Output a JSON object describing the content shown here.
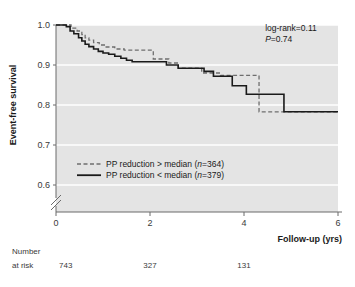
{
  "chart_data": {
    "type": "line",
    "subtype": "kaplan-meier-step",
    "title": "",
    "xlabel": "Follow-up (yrs)",
    "ylabel": "Event-free survival",
    "xlim": [
      0,
      6
    ],
    "ylim": [
      0.6,
      1.0
    ],
    "y_axis_break": true,
    "xticks": [
      0,
      2,
      4,
      6
    ],
    "xtick_labels": [
      "0",
      "2",
      "4",
      "6"
    ],
    "yticks": [
      0.6,
      0.7,
      0.8,
      0.9,
      1.0
    ],
    "ytick_labels": [
      "0.6",
      "0.7",
      "0.8",
      "0.9",
      "1.0"
    ],
    "grid": "horizontal-white",
    "plot_bg": "#e4e4e4",
    "legend_position": "lower-left-inside",
    "series": [
      {
        "name": "PP reduction > median (n=364)",
        "style": "dashed",
        "color": "#6e6e6e",
        "n": 364,
        "points": [
          [
            0.0,
            1.0
          ],
          [
            0.25,
            1.0
          ],
          [
            0.32,
            0.992
          ],
          [
            0.45,
            0.985
          ],
          [
            0.55,
            0.976
          ],
          [
            0.62,
            0.968
          ],
          [
            0.7,
            0.962
          ],
          [
            0.8,
            0.956
          ],
          [
            0.92,
            0.95
          ],
          [
            1.05,
            0.945
          ],
          [
            1.25,
            0.94
          ],
          [
            1.45,
            0.937
          ],
          [
            2.05,
            0.937
          ],
          [
            2.07,
            0.915
          ],
          [
            2.35,
            0.915
          ],
          [
            2.4,
            0.905
          ],
          [
            2.55,
            0.905
          ],
          [
            2.6,
            0.892
          ],
          [
            3.05,
            0.892
          ],
          [
            3.1,
            0.88
          ],
          [
            3.45,
            0.88
          ],
          [
            3.5,
            0.874
          ],
          [
            4.28,
            0.874
          ],
          [
            4.32,
            0.783
          ],
          [
            6.0,
            0.783
          ]
        ]
      },
      {
        "name": "PP reduction < median (n=379)",
        "style": "solid",
        "color": "#1a1a1a",
        "n": 379,
        "points": [
          [
            0.0,
            1.0
          ],
          [
            0.22,
            0.996
          ],
          [
            0.3,
            0.985
          ],
          [
            0.38,
            0.978
          ],
          [
            0.48,
            0.968
          ],
          [
            0.55,
            0.96
          ],
          [
            0.62,
            0.952
          ],
          [
            0.7,
            0.946
          ],
          [
            0.8,
            0.94
          ],
          [
            0.9,
            0.934
          ],
          [
            1.0,
            0.93
          ],
          [
            1.12,
            0.927
          ],
          [
            1.25,
            0.922
          ],
          [
            1.38,
            0.917
          ],
          [
            1.5,
            0.912
          ],
          [
            1.62,
            0.908
          ],
          [
            2.3,
            0.908
          ],
          [
            2.35,
            0.9
          ],
          [
            2.55,
            0.9
          ],
          [
            2.6,
            0.892
          ],
          [
            3.1,
            0.892
          ],
          [
            3.15,
            0.884
          ],
          [
            3.3,
            0.884
          ],
          [
            3.35,
            0.872
          ],
          [
            3.7,
            0.872
          ],
          [
            3.75,
            0.848
          ],
          [
            4.0,
            0.848
          ],
          [
            4.05,
            0.827
          ],
          [
            4.8,
            0.827
          ],
          [
            4.85,
            0.783
          ],
          [
            6.0,
            0.783
          ]
        ]
      }
    ],
    "annotations": [
      {
        "text": "log-rank=0.11",
        "x": 4.55,
        "y": 0.985
      },
      {
        "text": "P",
        "italic_prefix": true,
        "rest": "=0.74",
        "x": 4.55,
        "y": 0.96
      }
    ],
    "number_at_risk": {
      "label_line1": "Number",
      "label_line2": "at risk",
      "times": [
        0,
        2,
        4
      ],
      "values": [
        "743",
        "327",
        "131"
      ]
    }
  },
  "stats": {
    "logrank_label": "log-rank=0.11",
    "p_symbol": "P",
    "p_value": "=0.74"
  },
  "legend": {
    "items": [
      {
        "label": "PP reduction > median (",
        "n_symbol": "n",
        "n_text": "=364)"
      },
      {
        "label": "PP reduction < median (",
        "n_symbol": "n",
        "n_text": "=379)"
      }
    ]
  }
}
